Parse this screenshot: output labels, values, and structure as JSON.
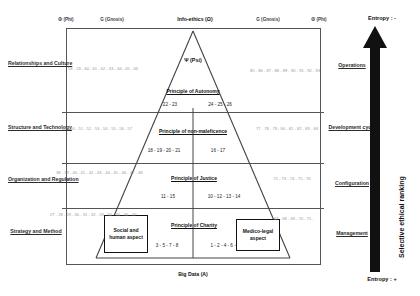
{
  "diagram": {
    "top_axis": [
      {
        "id": "phi-left",
        "label": "Φ (Phi)"
      },
      {
        "id": "gnosis-left",
        "label": "G (Gnosis)"
      },
      {
        "id": "info-ethics",
        "label": "Info-ethics (Ω)"
      },
      {
        "id": "gnosis-right",
        "label": "G (Gnosis)"
      },
      {
        "id": "phi-right",
        "label": "Φ (Phi)"
      }
    ],
    "apex_label": "Ψ (Psi)",
    "bottom_label": "Big Data (A)",
    "left_rows": [
      {
        "label": "Relationships and Culture",
        "numbers": "58 - 59 - 60 - 61 - 62 - 63 - 64 - 65 - 66"
      },
      {
        "label": "Structure and Technology",
        "numbers": "49 - 50 - 51 - 52 - 53 - 54 - 55 - 56 - 57"
      },
      {
        "label": "Organization and Regulation",
        "numbers": "38 - 39 - 40 - 41 - 42 - 43 - 44 - 45 - 46 - 47 - 48"
      },
      {
        "label": "Strategy and Method",
        "numbers": "27 - 28 - 29 - 30 - 31 - 32 - 33 - 34 - 35 - 36 - 37"
      }
    ],
    "right_rows": [
      {
        "label": "Operations",
        "numbers": "85 - 86 - 87 - 88 - 89 - 90 - 91 - 92 - 93"
      },
      {
        "label": "Development cycle",
        "numbers": "77 - 78 - 79 - 80 - 81 - 82 - 83 - 84"
      },
      {
        "label": "Configuration",
        "numbers": "72 - 73 - 74 - 75 - 76"
      },
      {
        "label": "Management",
        "numbers": "67 - 68 - 69 - 70 - 71 -"
      }
    ],
    "tiers": [
      {
        "id": "autonomy",
        "title": "Principle of Autonomy",
        "left_numbers": "22 - 23",
        "right_numbers": "24 - 25 - 26"
      },
      {
        "id": "non-maleficence",
        "title": "Principle of non-maleficence",
        "left_numbers": "18 - 19 - 20 - 21",
        "right_numbers": "16 - 17"
      },
      {
        "id": "justice",
        "title": "Principle of Justice",
        "left_numbers": "11 - 15",
        "right_numbers": "10 - 12 - 13 - 14"
      },
      {
        "id": "charity",
        "title": "Principle of Charity",
        "left_numbers": "3 - 5 - 7 - 8",
        "right_numbers": "1 - 2 - 4 - 6 - 9"
      }
    ],
    "aspect_boxes": [
      {
        "id": "social-human",
        "label": "Social and human aspect"
      },
      {
        "id": "medico-legal",
        "label": "Medico-legal aspect"
      }
    ],
    "entropy_axis": {
      "top_label": "Entropy : -",
      "bottom_label": "Entropy : +",
      "arrow_label": "Selective ethical ranking"
    },
    "colors": {
      "frame": "#555555",
      "text": "#111111",
      "faint_numbers": "#9a9a9a",
      "arrow": "#111111"
    }
  }
}
